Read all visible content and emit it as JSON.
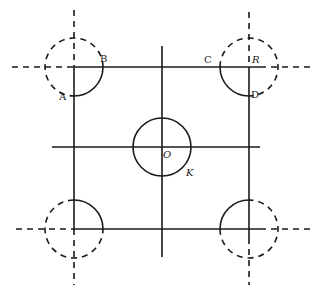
{
  "figure": {
    "stroke_color": "#1a1a1a",
    "background": "#ffffff"
  },
  "labels": {
    "A": "A",
    "B": "B",
    "C": "C",
    "D": "D",
    "R": "R",
    "O": "O",
    "K": "K"
  },
  "geometry": {
    "square": {
      "left": 74,
      "top": 67,
      "right": 249,
      "bottom": 229
    },
    "corner_arc_radius": 29,
    "center_circle": {
      "cx": 162,
      "cy": 147,
      "r": 29
    },
    "center_axes": {
      "horizontal": {
        "x1": 52,
        "x2": 260,
        "y": 147
      },
      "vertical": {
        "x": 162,
        "y1": 46,
        "y2": 257
      }
    }
  }
}
